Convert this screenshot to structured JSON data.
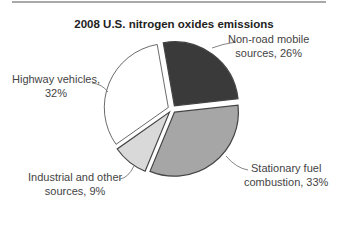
{
  "chart_data": {
    "type": "pie",
    "title": "2008 U.S. nitrogen oxides emissions",
    "categories": [
      "Non-road mobile sources",
      "Stationary fuel combustion",
      "Industrial and other sources",
      "Highway vehicles"
    ],
    "values": [
      26,
      33,
      9,
      32
    ],
    "unit": "%",
    "labels": [
      {
        "line1": "Non-road mobile",
        "line2": "sources, 26%"
      },
      {
        "line1": "Stationary fuel",
        "line2": "combustion, 33%"
      },
      {
        "line1": "Industrial and other",
        "line2": "sources, 9%"
      },
      {
        "line1": "Highway vehicles,",
        "line2": "32%"
      }
    ],
    "colors": [
      "#3a3a3a",
      "#a6a6a6",
      "#d9d9d9",
      "#ffffff"
    ],
    "legend": "none (callout labels)",
    "exploded": true
  }
}
